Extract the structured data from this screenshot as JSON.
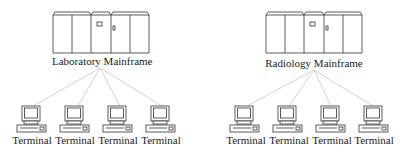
{
  "diagram": {
    "mainframes": [
      {
        "label": "Laboratory Mainframe",
        "terminals": [
          "Terminal",
          "Terminal",
          "Terminal",
          "Terminal"
        ]
      },
      {
        "label": "Radiology Mainframe",
        "terminals": [
          "Terminal",
          "Terminal",
          "Terminal",
          "Terminal"
        ]
      }
    ],
    "colors": {
      "line": "#c8c8c8",
      "stroke": "#333333"
    }
  }
}
